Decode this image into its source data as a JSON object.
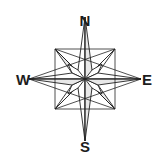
{
  "figure": {
    "name": "compass-rose",
    "background_color": "#ffffff",
    "stroke_color": "#232323",
    "fill_light": "#ffffff",
    "fill_shade": "#e8e8e8",
    "width": 163,
    "height": 155
  },
  "compass": {
    "center_x": 85,
    "center_y": 79,
    "cardinal_radius_vertical": 62,
    "cardinal_radius_horizontal": 56,
    "intercardinal_radius": 43,
    "inner_radius": 15,
    "point_count": 8,
    "labels": {
      "north": "N",
      "east": "E",
      "south": "S",
      "west": "W"
    },
    "label_positions": {
      "north": {
        "x": 85,
        "y": 26
      },
      "east": {
        "x": 147,
        "y": 85
      },
      "south": {
        "x": 85,
        "y": 152
      },
      "west": {
        "x": 23,
        "y": 85
      }
    }
  }
}
